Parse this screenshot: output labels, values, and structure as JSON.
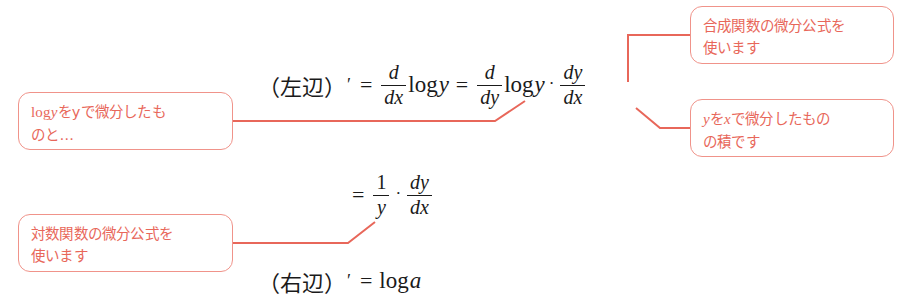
{
  "figure": {
    "background_color": "#ffffff",
    "accent_color": "#e8675a",
    "callout_border_color": "#f0938a",
    "equation_color": "#1a1a1a"
  },
  "equations": [
    {
      "id": "line-1",
      "plain_text": "(左辺)′ = d/dx log y = d/dy log y · dy/dx",
      "lhs_label": "（左辺）",
      "prime": "′",
      "equals_1": "=",
      "frac_1": {
        "num": "d",
        "den": "dx"
      },
      "log_1": "log",
      "var_1": "y",
      "equals_2": "=",
      "frac_2": {
        "num": "d",
        "den": "dy"
      },
      "log_2": "log",
      "var_2": "y",
      "dot": "·",
      "frac_3": {
        "num": "dy",
        "den": "dx"
      }
    },
    {
      "id": "line-2",
      "plain_text": "= 1/y · dy/dx",
      "equals": "=",
      "frac_1": {
        "num": "1",
        "den": "y"
      },
      "dot": "·",
      "frac_2": {
        "num": "dy",
        "den": "dx"
      }
    },
    {
      "id": "line-3",
      "plain_text": "(右辺)′ = log a",
      "lhs_label": "（右辺）",
      "prime": "′",
      "equals": "=",
      "log": "log",
      "var": "a"
    }
  ],
  "callouts": [
    {
      "id": "log-y-derivative",
      "position": "upper-left",
      "full_text": "logyをyで微分したものと…",
      "line_1_prefix_log": "log",
      "line_1_prefix_var": "y",
      "line_1_rest": "をyで微分したも",
      "line_2": "のと…"
    },
    {
      "id": "composite-rule",
      "position": "upper-right",
      "full_text": "合成関数の微分公式を使います",
      "line_1": "合成関数の微分公式を",
      "line_2": "使います"
    },
    {
      "id": "y-by-x",
      "position": "middle-right",
      "full_text": "yをxで微分したものの積です",
      "line_1_var_y": "y",
      "line_1_mid": "を",
      "line_1_var_x": "x",
      "line_1_rest": "で微分したもの",
      "line_2": "の積です"
    },
    {
      "id": "log-rule",
      "position": "lower-left",
      "full_text": "対数関数の微分公式を使います",
      "line_1": "対数関数の微分公式を",
      "line_2": "使います"
    }
  ],
  "connectors": [
    {
      "id": "log-y-derivative-leader",
      "from_callout": "log-y-derivative",
      "to_target": "d/dy log y term",
      "path": "M 233 121 L 495 121 L 525 101"
    },
    {
      "id": "composite-rule-leader",
      "from_callout": "composite-rule",
      "to_target": "multiplication dot",
      "path": "M 690 35 L 628 35 L 628 82"
    },
    {
      "id": "y-by-x-leader",
      "from_callout": "y-by-x",
      "to_target": "dy/dx term",
      "path": "M 690 128 L 660 128 L 636 108"
    },
    {
      "id": "log-rule-leader",
      "from_callout": "log-rule",
      "to_target": "1/y term",
      "path": "M 233 243 L 348 243 L 375 222"
    }
  ]
}
